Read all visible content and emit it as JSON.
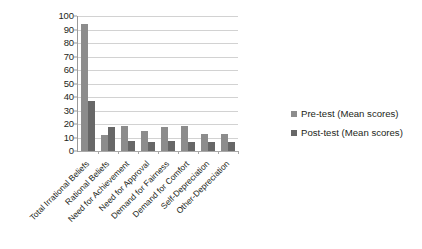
{
  "chart_data": {
    "type": "bar",
    "title": "",
    "subtitle": "",
    "xlabel": "",
    "ylabel": "",
    "ylim": [
      0,
      100
    ],
    "ytick_step": 10,
    "yticks": [
      "100",
      "90",
      "80",
      "70",
      "60",
      "50",
      "40",
      "30",
      "20",
      "10",
      "0"
    ],
    "grid": true,
    "legend_position": "right",
    "orientation": "vertical",
    "grouping": "clustered",
    "categories": [
      "Total Irrational Beliefs",
      "Rational Beliefs",
      "Need for Achievement",
      "Need for Approval",
      "Demand for Fairness",
      "Demand for Comfort",
      "Self-Depreciation",
      "Other-Depreciation"
    ],
    "series": [
      {
        "name": "Pre-test (Mean scores)",
        "color": "#8c8c8c",
        "values": [
          94,
          11.5,
          18.5,
          14.5,
          17.5,
          18.5,
          12.5,
          12.5
        ]
      },
      {
        "name": "Post-test (Mean scores)",
        "color": "#676767",
        "values": [
          37,
          17.5,
          7.5,
          6.5,
          7.5,
          6.5,
          6.5,
          6.5
        ]
      }
    ]
  },
  "legend": {
    "items": [
      {
        "label": "Pre-test (Mean scores)",
        "color": "#8c8c8c"
      },
      {
        "label": "Post-test (Mean scores)",
        "color": "#676767"
      }
    ]
  },
  "colors": {
    "pre_test": "#8c8c8c",
    "post_test": "#676767",
    "gridline": "#d2d2d2",
    "axis": "#9a9a9a",
    "text": "#231f20",
    "background": "#ffffff"
  }
}
